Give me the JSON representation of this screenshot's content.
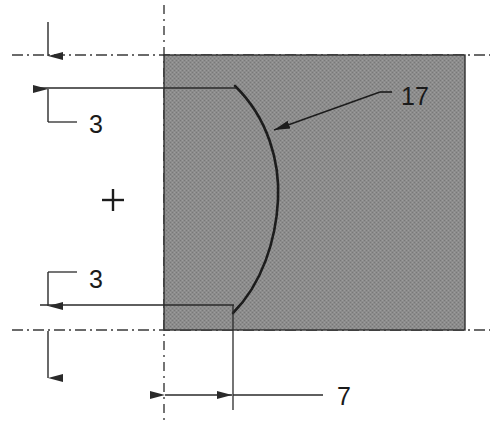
{
  "drawing": {
    "title": "Engineering part cross-section with concave arc",
    "units_note": "",
    "colors": {
      "fill_gray": "#8c8c8c",
      "outline": "#1c1c1c",
      "dimension_line": "#2a2a2a",
      "centerline": "#3a3a3a",
      "background": "#ffffff"
    },
    "body_shape": {
      "name": "hatched-rectangle",
      "left": 164,
      "top": 55,
      "right": 465,
      "bottom": 330
    },
    "arc": {
      "name": "concave-arc",
      "start_x": 235,
      "start_y": 86,
      "end_x": 233,
      "end_y": 313,
      "apex_x": 278,
      "apex_y": 200
    },
    "dimensions": [
      {
        "id": "top-offset",
        "label": "3",
        "label_x": 97,
        "label_y": 132,
        "orientation": "vertical",
        "line_x": 48,
        "from_y": 55,
        "to_y": 88
      },
      {
        "id": "bottom-offset",
        "label": "3",
        "label_x": 97,
        "label_y": 287,
        "orientation": "vertical",
        "line_x": 48,
        "from_y": 305,
        "to_y": 350
      },
      {
        "id": "arc-depth",
        "label": "7",
        "label_x": 337,
        "label_y": 405,
        "orientation": "horizontal",
        "line_y": 395,
        "from_x": 164,
        "to_x": 233
      }
    ],
    "leader": {
      "id": "arc-callout",
      "label": "17",
      "label_x": 400,
      "label_y": 105,
      "tip_x": 272,
      "tip_y": 131,
      "elbow_x": 380,
      "elbow_y": 92,
      "tail_x": 392,
      "tail_y": 92
    },
    "center_mark": {
      "name": "plus-center-mark",
      "x": 113,
      "y": 200,
      "size": 11
    },
    "centerlines": [
      {
        "id": "horizontal-centerline-top",
        "x1": 12,
        "y1": 55,
        "x2": 490,
        "y2": 55
      },
      {
        "id": "horizontal-centerline-bottom",
        "x1": 12,
        "y1": 330,
        "x2": 490,
        "y2": 330
      },
      {
        "id": "vertical-centerline-left",
        "x1": 164,
        "y1": 5,
        "x2": 164,
        "y2": 425
      }
    ]
  }
}
